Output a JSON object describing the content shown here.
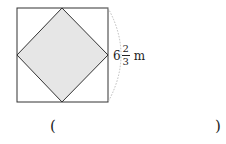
{
  "figure": {
    "side_label": {
      "whole": "6",
      "numerator": "2",
      "denominator": "3",
      "unit": "m"
    },
    "colors": {
      "stroke": "#333333",
      "fill": "#e6e6e6",
      "arc": "#bbbbbb"
    }
  },
  "answer": {
    "open_paren": "(",
    "close_paren": ")",
    "value": ""
  }
}
